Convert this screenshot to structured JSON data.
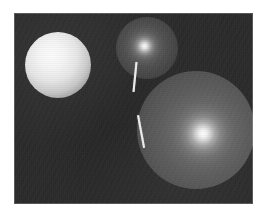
{
  "figure": {
    "kind": "rendered-image",
    "caption": "",
    "canvas": {
      "width": 266,
      "height": 216,
      "background_color": "#ffffff"
    },
    "plate": {
      "x": 14,
      "y": 13,
      "width": 239,
      "height": 191,
      "background_color": "#232323",
      "border_color": "#3a3a3a",
      "texture": "noisy-grain"
    }
  },
  "objects": [
    {
      "name": "sphere-left",
      "label": "Left sphere",
      "shape": "sphere",
      "shading": "diffuse-matte",
      "center_x": 58,
      "center_y": 65,
      "radius": 33,
      "base_color": "#f6f6f6",
      "highlight_color": "#fdfdfd",
      "highlight_x": 47,
      "highlight_y": 54,
      "shadow_color": "#3e3e3e"
    },
    {
      "name": "sphere-top",
      "label": "Top middle sphere",
      "shape": "sphere",
      "shading": "specular-glossy",
      "center_x": 147,
      "center_y": 48,
      "radius": 31,
      "base_color": "#4a4a4a",
      "highlight_color": "#fafafa",
      "highlight_x": 146,
      "highlight_y": 44,
      "shadow_color": "#262626"
    },
    {
      "name": "sphere-large",
      "label": "Large lower right sphere",
      "shape": "sphere",
      "shading": "specular-glossy",
      "center_x": 196,
      "center_y": 130,
      "radius": 59,
      "base_color": "#585858",
      "highlight_color": "#ffffff",
      "highlight_x": 190,
      "highlight_y": 145,
      "shadow_color": "#2e2e2e"
    }
  ],
  "markers": [
    {
      "name": "marker-line-upper",
      "label": "Upper line marker",
      "color": "#efefee",
      "x1": 136,
      "y1": 62,
      "x2": 133,
      "y2": 92,
      "length": 31,
      "thickness": 2,
      "angle_deg": 6
    },
    {
      "name": "marker-line-lower",
      "label": "Lower line marker",
      "color": "#efefee",
      "x1": 138,
      "y1": 115,
      "x2": 144,
      "y2": 147,
      "length": 33,
      "thickness": 2,
      "angle_deg": -10
    }
  ],
  "palette": {
    "page_background": "#ffffff",
    "scene_background": "#232323",
    "sphere_bright": "#f6f6f6",
    "sphere_grey": "#585858",
    "marker": "#efefee"
  }
}
